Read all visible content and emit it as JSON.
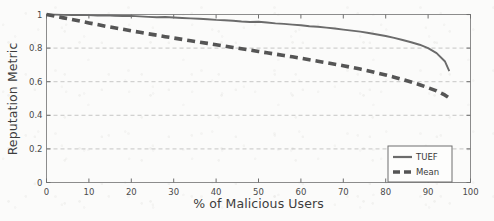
{
  "chart_data": {
    "type": "line",
    "title": "",
    "xlabel": "% of Malicious Users",
    "ylabel": "Reputation Metric",
    "xlim": [
      0,
      100
    ],
    "ylim": [
      0,
      1
    ],
    "xticks": [
      "0",
      "10",
      "20",
      "30",
      "40",
      "50",
      "60",
      "70",
      "80",
      "90",
      "100"
    ],
    "xtick_values": [
      0,
      10,
      20,
      30,
      40,
      50,
      60,
      70,
      80,
      90,
      100
    ],
    "yticks": [
      "0",
      "0.2",
      "0.4",
      "0.6",
      "0.8",
      "1"
    ],
    "ytick_values": [
      0,
      0.2,
      0.4,
      0.6,
      0.8,
      1
    ],
    "grid": {
      "horizontal": true,
      "vertical": false,
      "style": "dashed",
      "color": "#b9b9b9"
    },
    "legend": {
      "position": "lower-right",
      "border": true
    },
    "x": [
      0,
      2,
      4,
      6,
      8,
      10,
      12,
      14,
      16,
      18,
      20,
      22,
      24,
      26,
      28,
      30,
      32,
      34,
      36,
      38,
      40,
      42,
      44,
      46,
      48,
      50,
      52,
      54,
      56,
      58,
      60,
      62,
      64,
      66,
      68,
      70,
      72,
      74,
      76,
      78,
      80,
      82,
      84,
      86,
      88,
      90,
      92,
      94,
      95
    ],
    "series": [
      {
        "name": "TUEF",
        "style": "solid",
        "color": "#6b6b6b",
        "width": 1.9,
        "values": [
          1.0,
          0.999,
          0.998,
          0.997,
          0.998,
          0.996,
          0.994,
          0.995,
          0.993,
          0.991,
          0.992,
          0.989,
          0.986,
          0.984,
          0.985,
          0.982,
          0.979,
          0.977,
          0.975,
          0.972,
          0.968,
          0.966,
          0.963,
          0.958,
          0.955,
          0.957,
          0.952,
          0.947,
          0.944,
          0.94,
          0.936,
          0.93,
          0.927,
          0.922,
          0.917,
          0.91,
          0.904,
          0.898,
          0.89,
          0.881,
          0.872,
          0.861,
          0.848,
          0.835,
          0.82,
          0.8,
          0.77,
          0.72,
          0.663
        ]
      },
      {
        "name": "Mean",
        "style": "dashed",
        "color": "#555555",
        "width": 3.6,
        "values": [
          1.0,
          0.99,
          0.98,
          0.97,
          0.96,
          0.95,
          0.94,
          0.93,
          0.921,
          0.912,
          0.903,
          0.894,
          0.885,
          0.877,
          0.868,
          0.86,
          0.852,
          0.844,
          0.836,
          0.828,
          0.82,
          0.812,
          0.804,
          0.796,
          0.788,
          0.78,
          0.772,
          0.764,
          0.756,
          0.748,
          0.74,
          0.731,
          0.722,
          0.713,
          0.704,
          0.695,
          0.685,
          0.675,
          0.664,
          0.652,
          0.64,
          0.627,
          0.613,
          0.598,
          0.582,
          0.564,
          0.545,
          0.52,
          0.503
        ]
      }
    ]
  }
}
